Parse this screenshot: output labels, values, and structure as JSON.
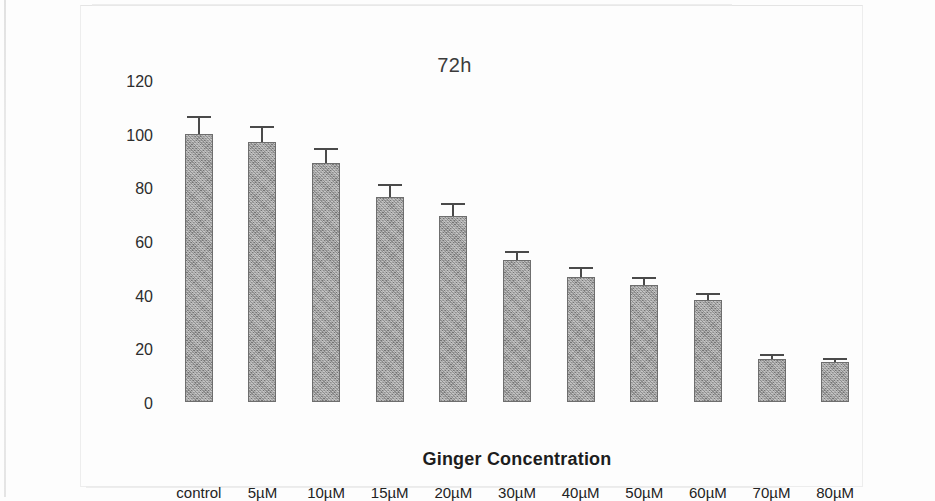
{
  "chart_data": {
    "type": "bar",
    "title": "72h",
    "xlabel": "Ginger Concentration",
    "ylabel": "Cell Viability %",
    "categories": [
      "control",
      "5µM",
      "10µM",
      "15µM",
      "20µM",
      "30µM",
      "40µM",
      "50µM",
      "60µM",
      "70µM",
      "80µM"
    ],
    "values": [
      100,
      97,
      89,
      76.5,
      69.5,
      53,
      46.5,
      43.5,
      38,
      16,
      15
    ],
    "errors": [
      6,
      5,
      5,
      4,
      4,
      2.5,
      3,
      2.5,
      2,
      1,
      0.8
    ],
    "ylim": [
      0,
      120
    ],
    "yticks": [
      0,
      20,
      40,
      60,
      80,
      100,
      120
    ],
    "ytick_labels": [
      "0",
      "20",
      "40",
      "60",
      "80",
      "100",
      "120"
    ],
    "grid": false,
    "legend": false,
    "bar_color": "#9d9d9d",
    "bar_edge_color": "#6e6e6e",
    "error_color": "#4a4a4a"
  }
}
